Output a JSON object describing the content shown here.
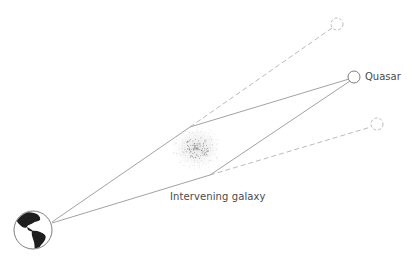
{
  "diagram": {
    "labels": {
      "quasar": "Quasar",
      "galaxy": "Intervening galaxy"
    },
    "colors": {
      "line": "#8a8a8a",
      "dashed_line": "#a8a8a8",
      "earth_land": "#1e1e1e",
      "text": "#4a4a4a",
      "galaxy_dots": "#9a9a9a"
    },
    "nodes": {
      "earth": {
        "cx": 33,
        "cy": 230,
        "r": 19
      },
      "quasar": {
        "cx": 354,
        "cy": 77,
        "r": 6
      },
      "image_upper": {
        "cx": 337,
        "cy": 24,
        "r": 6
      },
      "image_lower": {
        "cx": 377,
        "cy": 124,
        "r": 6
      },
      "galaxy": {
        "cx": 197,
        "cy": 148,
        "r": 22
      },
      "deflection_upper": {
        "x": 190,
        "y": 127
      },
      "deflection_lower": {
        "x": 210,
        "y": 175
      }
    }
  }
}
